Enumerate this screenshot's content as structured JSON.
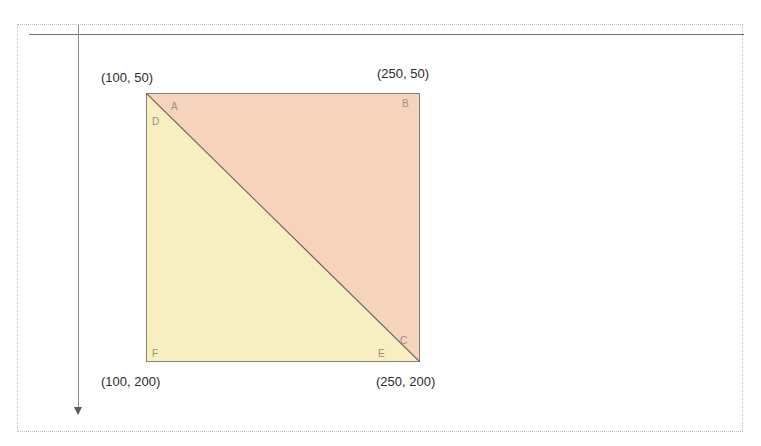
{
  "figure": {
    "square": {
      "vertex_labels": {
        "a": "A",
        "b": "B",
        "c": "C",
        "d": "D",
        "e": "E",
        "f": "F"
      },
      "corner_coordinates": {
        "top_left": "(100, 50)",
        "top_right": "(250, 50)",
        "bottom_left": "(100, 200)",
        "bottom_right": "(250, 200)"
      }
    },
    "colors": {
      "upper_triangle_fill": "#f6d3bd",
      "lower_triangle_fill": "#f7eec2",
      "outline": "#8a7f72",
      "diagonal": "#6d6154",
      "coordinate_text": "#2b2b2b",
      "vertex_label_text": "#9b8f7f",
      "page_frame": "#bdbdbd",
      "rule_line": "#6f6f6f",
      "guide_line": "#8c8c8c"
    }
  }
}
